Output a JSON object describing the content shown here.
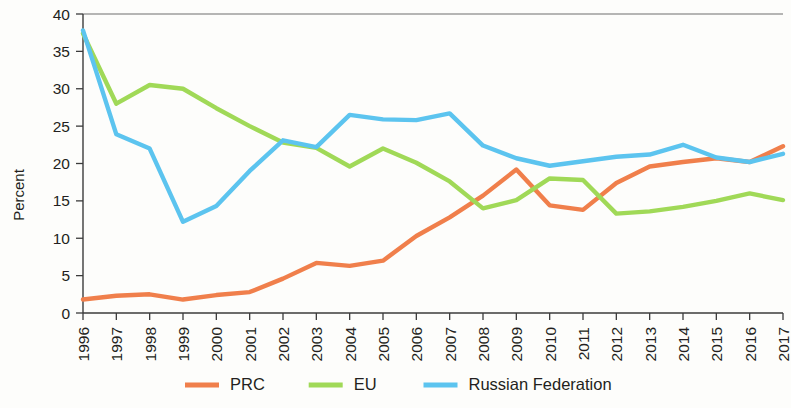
{
  "chart_data": {
    "type": "line",
    "title": "",
    "subtitle": "",
    "xlabel": "",
    "ylabel": "Percent",
    "categories": [
      "1996",
      "1997",
      "1998",
      "1999",
      "2000",
      "2001",
      "2002",
      "2003",
      "2004",
      "2005",
      "2006",
      "2007",
      "2008",
      "2009",
      "2010",
      "2011",
      "2012",
      "2013",
      "2014",
      "2015",
      "2016",
      "2017"
    ],
    "xlim": [
      "1996",
      "2017"
    ],
    "ylim": [
      0,
      40
    ],
    "yticks": [
      0,
      5,
      10,
      15,
      20,
      25,
      30,
      35,
      40
    ],
    "grid": false,
    "legend_position": "bottom",
    "series": [
      {
        "name": "PRC",
        "color": "#f07f4b",
        "values": [
          1.8,
          2.3,
          2.5,
          1.8,
          2.4,
          2.8,
          4.6,
          6.7,
          6.3,
          7.0,
          10.3,
          12.8,
          15.7,
          19.2,
          14.4,
          13.8,
          17.4,
          19.6,
          20.2,
          20.7,
          20.2,
          22.3
        ]
      },
      {
        "name": "EU",
        "color": "#a0d957",
        "values": [
          37.4,
          28.0,
          30.5,
          30.0,
          27.4,
          25.0,
          22.8,
          22.1,
          19.6,
          22.0,
          20.1,
          17.6,
          14.0,
          15.1,
          18.0,
          17.8,
          13.3,
          13.6,
          14.2,
          15.0,
          16.0,
          15.1
        ]
      },
      {
        "name": "Russian Federation",
        "color": "#5cc4ef",
        "values": [
          37.8,
          23.9,
          22.0,
          12.2,
          14.3,
          19.0,
          23.1,
          22.2,
          26.5,
          25.9,
          25.8,
          26.7,
          22.4,
          20.7,
          19.7,
          20.3,
          20.9,
          21.2,
          22.5,
          20.8,
          20.2,
          21.3
        ]
      }
    ]
  },
  "axes": {
    "y_axis_title": "Percent"
  },
  "legend": {
    "items": [
      {
        "label": "PRC",
        "color": "#f07f4b"
      },
      {
        "label": "EU",
        "color": "#a0d957"
      },
      {
        "label": "Russian Federation",
        "color": "#5cc4ef"
      }
    ]
  }
}
